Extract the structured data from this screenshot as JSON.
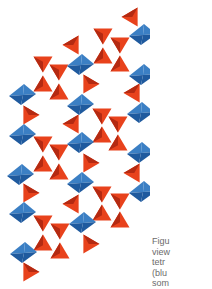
{
  "figure": {
    "colors": {
      "octahedron_light": "#3b7fc4",
      "octahedron_dark": "#1f5a9e",
      "tetrahedron_light": "#e8421c",
      "tetrahedron_dark": "#b42a12"
    },
    "octahedra": [
      [
        142,
        35
      ],
      [
        80,
        65
      ],
      [
        142,
        75
      ],
      [
        22,
        95
      ],
      [
        80,
        105
      ],
      [
        140,
        113
      ],
      [
        22,
        135
      ],
      [
        80,
        143
      ],
      [
        140,
        153
      ],
      [
        20,
        175
      ],
      [
        80,
        183
      ],
      [
        142,
        192
      ],
      [
        22,
        213
      ],
      [
        82,
        223
      ],
      [
        23,
        253
      ]
    ],
    "tetrahedra": [
      {
        "x": 131,
        "y": 17,
        "dir": "left"
      },
      {
        "x": 103,
        "y": 36,
        "dir": "down"
      },
      {
        "x": 103,
        "y": 56,
        "dir": "up"
      },
      {
        "x": 120,
        "y": 45,
        "dir": "down"
      },
      {
        "x": 120,
        "y": 64,
        "dir": "up"
      },
      {
        "x": 72,
        "y": 45,
        "dir": "left"
      },
      {
        "x": 43,
        "y": 64,
        "dir": "down"
      },
      {
        "x": 43,
        "y": 84,
        "dir": "up"
      },
      {
        "x": 59,
        "y": 72,
        "dir": "down"
      },
      {
        "x": 59,
        "y": 92,
        "dir": "up"
      },
      {
        "x": 90,
        "y": 84,
        "dir": "right"
      },
      {
        "x": 133,
        "y": 93,
        "dir": "left"
      },
      {
        "x": 30,
        "y": 115,
        "dir": "right"
      },
      {
        "x": 72,
        "y": 124,
        "dir": "left"
      },
      {
        "x": 102,
        "y": 116,
        "dir": "down"
      },
      {
        "x": 102,
        "y": 135,
        "dir": "up"
      },
      {
        "x": 118,
        "y": 124,
        "dir": "down"
      },
      {
        "x": 118,
        "y": 143,
        "dir": "up"
      },
      {
        "x": 43,
        "y": 144,
        "dir": "down"
      },
      {
        "x": 43,
        "y": 164,
        "dir": "up"
      },
      {
        "x": 59,
        "y": 152,
        "dir": "down"
      },
      {
        "x": 59,
        "y": 172,
        "dir": "up"
      },
      {
        "x": 90,
        "y": 163,
        "dir": "right"
      },
      {
        "x": 133,
        "y": 173,
        "dir": "left"
      },
      {
        "x": 30,
        "y": 193,
        "dir": "right"
      },
      {
        "x": 72,
        "y": 204,
        "dir": "left"
      },
      {
        "x": 102,
        "y": 194,
        "dir": "down"
      },
      {
        "x": 102,
        "y": 213,
        "dir": "up"
      },
      {
        "x": 120,
        "y": 201,
        "dir": "down"
      },
      {
        "x": 120,
        "y": 220,
        "dir": "up"
      },
      {
        "x": 43,
        "y": 223,
        "dir": "down"
      },
      {
        "x": 43,
        "y": 243,
        "dir": "up"
      },
      {
        "x": 60,
        "y": 231,
        "dir": "down"
      },
      {
        "x": 60,
        "y": 251,
        "dir": "up"
      },
      {
        "x": 90,
        "y": 244,
        "dir": "right"
      },
      {
        "x": 30,
        "y": 272,
        "dir": "right"
      }
    ]
  },
  "caption": {
    "lines": [
      "Figu",
      "view",
      "tetr",
      "(blu",
      "som"
    ]
  }
}
